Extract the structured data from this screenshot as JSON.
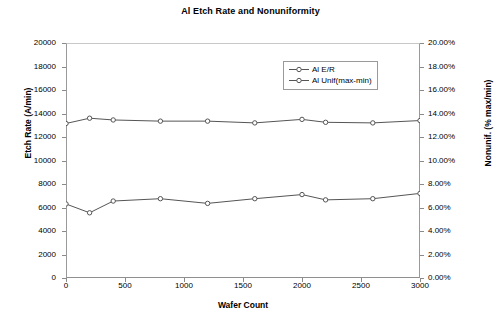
{
  "chart_data": {
    "type": "line",
    "title": "Al Etch Rate and Nonuniformity",
    "xlabel": "Wafer Count",
    "ylabel": "Etch Rate (A/min)",
    "y2label": "Nonunif. (% max/min)",
    "x": [
      0,
      200,
      400,
      800,
      1200,
      1600,
      2000,
      2200,
      2600,
      3000
    ],
    "xlim": [
      0,
      3000
    ],
    "xticks": [
      0,
      500,
      1000,
      1500,
      2000,
      2500,
      3000
    ],
    "xticklabels": [
      "0",
      "500",
      "1000",
      "1500",
      "2000",
      "2500",
      "3000"
    ],
    "ylim": [
      0,
      20000
    ],
    "yticks": [
      0,
      2000,
      4000,
      6000,
      8000,
      10000,
      12000,
      14000,
      16000,
      18000,
      20000
    ],
    "yticklabels": [
      "0",
      "2000",
      "4000",
      "6000",
      "8000",
      "10000",
      "12000",
      "14000",
      "16000",
      "18000",
      "20000"
    ],
    "y2lim": [
      0,
      20
    ],
    "y2ticks": [
      0,
      2,
      4,
      6,
      8,
      10,
      12,
      14,
      16,
      18,
      20
    ],
    "y2ticklabels": [
      "0.00%",
      "2.00%",
      "4.00%",
      "6.00%",
      "8.00%",
      "10.00%",
      "12.00%",
      "14.00%",
      "16.00%",
      "18.00%",
      "20.00%"
    ],
    "grid": false,
    "legend_position": "upper right",
    "series": [
      {
        "name": "Al E/R",
        "axis": "left",
        "marker": "open-circle",
        "color": "#555555",
        "values": [
          13150,
          13600,
          13450,
          13350,
          13350,
          13200,
          13500,
          13250,
          13200,
          13400
        ]
      },
      {
        "name": "Al Unif(max-min)",
        "axis": "right",
        "marker": "open-circle",
        "color": "#555555",
        "values": [
          6.3,
          5.55,
          6.55,
          6.75,
          6.35,
          6.75,
          7.1,
          6.65,
          6.75,
          7.2
        ]
      }
    ],
    "legend": [
      "Al E/R",
      "Al Unif(max-min)"
    ]
  },
  "colors": {
    "series_line": "#555555",
    "axis": "#8a8a8a",
    "frame": "#9a9a9a",
    "text": "#000000",
    "background": "#ffffff"
  }
}
